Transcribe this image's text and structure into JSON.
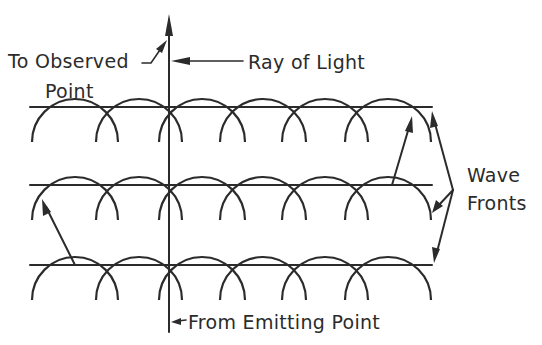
{
  "diagram": {
    "title": "",
    "labels": {
      "to_observed_line1": "To Observed",
      "to_observed_line2": "Point",
      "ray_of_light": "Ray of Light",
      "wave_fronts_line1": "Wave",
      "wave_fronts_line2": "Fronts",
      "from_emitting_point": "From Emitting Point"
    },
    "wave_fronts": [
      {
        "y": 107,
        "x_start": 30,
        "x_end": 432
      },
      {
        "y": 185,
        "x_start": 30,
        "x_end": 432
      },
      {
        "y": 265,
        "x_start": 30,
        "x_end": 432
      }
    ],
    "wavelet_centers_x": [
      75,
      139,
      202,
      263,
      325,
      388
    ],
    "wavelet_radius": 43,
    "ray": {
      "x": 169,
      "y_top": 15,
      "y_bottom": 332
    },
    "colors": {
      "ink": "#2b2b2b",
      "background": "#ffffff"
    }
  }
}
